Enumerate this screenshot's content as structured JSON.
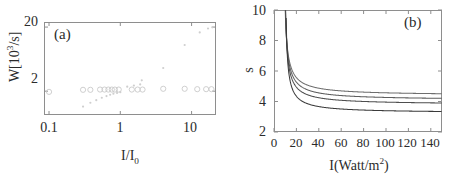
{
  "figure": {
    "panel_a_tag": "(a)",
    "panel_b_tag": "(b)"
  },
  "chart_data": [
    {
      "type": "scatter",
      "panel": "a",
      "title": "(a)",
      "xlabel": "I/I0",
      "ylabel": "W[10^3/s]",
      "xscale": "log",
      "yscale": "log",
      "xlim": [
        0.085,
        22
      ],
      "ylim": [
        0.85,
        24
      ],
      "xticks": [
        0.1,
        1,
        10
      ],
      "xtick_labels": [
        "0.1",
        "1",
        "10"
      ],
      "yticks": [
        2,
        20
      ],
      "ytick_labels": [
        "2",
        "20"
      ],
      "grid": false,
      "legend": "none",
      "series": [
        {
          "name": "open-circles",
          "marker": "open-circle",
          "x": [
            0.1,
            0.3,
            0.38,
            0.52,
            0.6,
            0.68,
            0.76,
            0.84,
            0.95,
            1.45,
            1.75,
            2.05,
            4.0,
            8.0,
            12.0,
            16.0,
            19.0
          ],
          "y": [
            1.95,
            2.1,
            2.1,
            2.12,
            2.12,
            2.12,
            2.12,
            2.12,
            2.12,
            2.12,
            2.12,
            2.12,
            2.18,
            2.18,
            2.15,
            2.15,
            2.15
          ]
        },
        {
          "name": "small-dots",
          "marker": "dot",
          "x": [
            0.3,
            0.38,
            0.46,
            0.55,
            0.64,
            0.72,
            0.8,
            0.9,
            1.0,
            1.25,
            1.55,
            1.9,
            2.0,
            4.0,
            8.0,
            13.0,
            17.0,
            19.5
          ],
          "y": [
            1.15,
            1.32,
            1.45,
            1.58,
            1.68,
            1.76,
            1.83,
            1.88,
            1.93,
            2.35,
            2.45,
            2.55,
            2.95,
            4.6,
            10.5,
            16.5,
            19.0,
            19.8
          ]
        }
      ]
    },
    {
      "type": "line",
      "panel": "b",
      "title": "(b)",
      "xlabel": "I(Watt/m2)",
      "ylabel": "s",
      "xlim": [
        0,
        150
      ],
      "ylim": [
        2,
        10
      ],
      "xticks": [
        0,
        20,
        40,
        60,
        80,
        100,
        120,
        140
      ],
      "xtick_labels": [
        "0",
        "20",
        "40",
        "60",
        "80",
        "100",
        "120",
        "140"
      ],
      "yticks": [
        2,
        4,
        6,
        8,
        10
      ],
      "ytick_labels": [
        "2",
        "4",
        "6",
        "8",
        "10"
      ],
      "grid": false,
      "legend": "none",
      "series": [
        {
          "name": "curve-1",
          "asymptote": 4.4,
          "x0": 8.6,
          "color": "#6e6e6e"
        },
        {
          "name": "curve-2",
          "asymptote": 4.1,
          "x0": 9.0,
          "color": "#5e5e5e"
        },
        {
          "name": "curve-3",
          "asymptote": 3.8,
          "x0": 9.3,
          "color": "#4e4e4e"
        },
        {
          "name": "curve-4",
          "asymptote": 3.25,
          "x0": 10.0,
          "color": "#3a3a3a"
        }
      ]
    }
  ],
  "panel_a": {
    "tag": "(a)",
    "ylabel_prefix": "W[10",
    "ylabel_exp": "3",
    "ylabel_suffix": "/s]",
    "xlabel_main": "I/I",
    "xlabel_sub": "0",
    "yticks": [
      "20",
      "2"
    ],
    "xticks": [
      "0.1",
      "1",
      "10"
    ]
  },
  "panel_b": {
    "tag": "(b)",
    "ylabel": "s",
    "xlabel_main": "I(Watt/m",
    "xlabel_exp": "2",
    "xlabel_close": ")",
    "yticks": [
      "10",
      "8",
      "6",
      "4",
      "2"
    ],
    "xticks": [
      "0",
      "20",
      "40",
      "60",
      "80",
      "100",
      "120",
      "140"
    ]
  }
}
